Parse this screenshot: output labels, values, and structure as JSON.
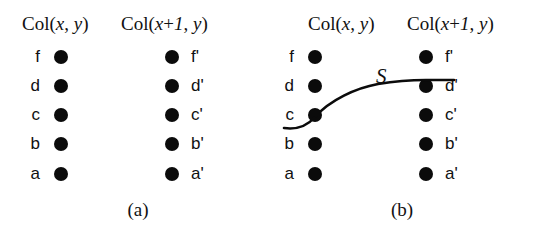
{
  "figure": {
    "background_color": "#ffffff",
    "foreground_color": "#111111",
    "node_color": "#0b0b0b"
  },
  "headers": {
    "left_prefix": "Col(",
    "left_x": "x",
    "left_comma": ", ",
    "left_y": "y",
    "left_suffix": ")",
    "right_prefix": "Col(",
    "right_x": "x",
    "right_plus": "+",
    "right_one": "1",
    "right_comma": ", ",
    "right_y": "y",
    "right_suffix": ")",
    "left_full": "Col(x, y)",
    "right_full": "Col(x+1, y)"
  },
  "rows": [
    {
      "left_label": "f",
      "right_label": "f'"
    },
    {
      "left_label": "d",
      "right_label": "d'"
    },
    {
      "left_label": "c",
      "right_label": "c'"
    },
    {
      "left_label": "b",
      "right_label": "b'"
    },
    {
      "left_label": "a",
      "right_label": "a'"
    }
  ],
  "panel_a": {
    "caption": "(a)",
    "has_curve": false
  },
  "panel_b": {
    "caption": "(b)",
    "has_curve": true,
    "curve_label": "S",
    "curve_from_node": "c",
    "curve_to_node": "d'"
  }
}
